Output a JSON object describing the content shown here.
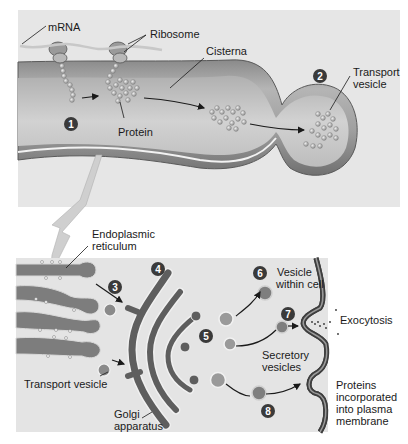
{
  "figure": {
    "top_panel": {
      "labels": {
        "mrna": "mRNA",
        "ribosome": "Ribosome",
        "cisterna": "Cisterna",
        "protein": "Protein",
        "transport_vesicle_line1": "Transport",
        "transport_vesicle_line2": "vesicle"
      },
      "steps": [
        "1",
        "2"
      ]
    },
    "bottom_panel": {
      "labels": {
        "er_line1": "Endoplasmic",
        "er_line2": "reticulum",
        "transport_vesicle": "Transport vesicle",
        "golgi_line1": "Golgi",
        "golgi_line2": "apparatus",
        "vesicle_within_cell_line1": "Vesicle",
        "vesicle_within_cell_line2": "within cell",
        "exocytosis": "Exocytosis",
        "secretory_line1": "Secretory",
        "secretory_line2": "vesicles",
        "proteins_line1": "Proteins",
        "proteins_line2": "incorporated",
        "proteins_line3": "into plasma",
        "proteins_line4": "membrane"
      },
      "steps": [
        "3",
        "4",
        "5",
        "6",
        "7",
        "8"
      ]
    },
    "colors": {
      "panel_bg": "#e4e4e4",
      "membrane_dark": "#5a5a5a",
      "organelle": "#7a7a7a",
      "badge": "#3a3a3a",
      "arrow_callout": "#c8c8c8"
    }
  }
}
